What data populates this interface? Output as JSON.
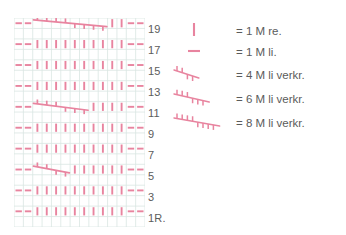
{
  "colors": {
    "symbol": "#e8849f",
    "symbol_dark": "#e06f8e",
    "grid_line": "#d9e6e2",
    "grid_line_strong": "#cfe0dc",
    "text": "#5b5b5b",
    "background": "#ffffff"
  },
  "chart": {
    "title": "",
    "columns": 14,
    "rows": 20,
    "row_labels": [
      {
        "text": "19",
        "row": 19
      },
      {
        "text": "17",
        "row": 17
      },
      {
        "text": "15",
        "row": 15
      },
      {
        "text": "13",
        "row": 13
      },
      {
        "text": "11",
        "row": 11
      },
      {
        "text": "9",
        "row": 9
      },
      {
        "text": "7",
        "row": 7
      },
      {
        "text": "5",
        "row": 5
      },
      {
        "text": "3",
        "row": 3
      },
      {
        "text": "1R.",
        "row": 1
      }
    ],
    "symbols": {
      "purl": "-",
      "knit": "|",
      "cable": "angled-line-with-ticks"
    },
    "rows_content": [
      {
        "row": 19,
        "type": "cable",
        "cable_span": 8,
        "purl_left": 2,
        "purl_right": 2
      },
      {
        "row": 17,
        "type": "knit",
        "purl_left": 2,
        "purl_right": 2
      },
      {
        "row": 15,
        "type": "knit",
        "purl_left": 2,
        "purl_right": 2
      },
      {
        "row": 13,
        "type": "knit",
        "purl_left": 2,
        "purl_right": 2
      },
      {
        "row": 11,
        "type": "cable",
        "cable_span": 6,
        "purl_left": 2,
        "purl_right": 2
      },
      {
        "row": 9,
        "type": "knit",
        "purl_left": 2,
        "purl_right": 2
      },
      {
        "row": 7,
        "type": "knit",
        "purl_left": 2,
        "purl_right": 2
      },
      {
        "row": 5,
        "type": "cable",
        "cable_span": 4,
        "purl_left": 2,
        "purl_right": 2
      },
      {
        "row": 3,
        "type": "knit",
        "purl_left": 2,
        "purl_right": 2
      },
      {
        "row": 1,
        "type": "knit",
        "purl_left": 2,
        "purl_right": 2
      }
    ]
  },
  "legend": {
    "items": [
      {
        "symbol": "knit-stitch-symbol",
        "text": "=  1 M re."
      },
      {
        "symbol": "purl-stitch-symbol",
        "text": "=  1 M li."
      },
      {
        "symbol": "cable-4-symbol",
        "text": "=  4 M li verkr."
      },
      {
        "symbol": "cable-6-symbol",
        "text": "=  6 M li verkr."
      },
      {
        "symbol": "cable-8-symbol",
        "text": "=  8 M li verkr."
      }
    ]
  }
}
